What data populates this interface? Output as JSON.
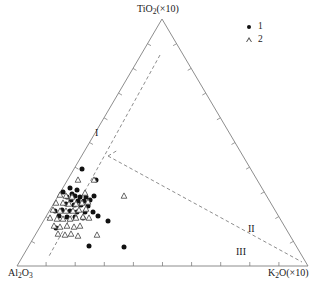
{
  "figure": {
    "type": "ternary-scatter",
    "width": 330,
    "height": 293,
    "background": "#ffffff",
    "line_color": "#808080",
    "marker_color_1": "#111111",
    "marker_color_2": "#555555"
  },
  "axes": {
    "top_label": "TiO₂(×10)",
    "top_label_parts": {
      "base": "TiO",
      "sub": "2",
      "suffix": "(×10)"
    },
    "left_label": "Al₂O₃",
    "left_label_parts": {
      "base": "Al",
      "sub": "2",
      "mid": "O",
      "sub2": "3"
    },
    "right_label": "K₂O(×10)",
    "right_label_parts": {
      "base": "K",
      "sub": "2",
      "suffix": "O(×10)"
    },
    "ticks_per_side": 10,
    "grid": false
  },
  "legend": {
    "position": "top-right",
    "items": [
      {
        "label": "1",
        "marker": "filled-circle",
        "icon": "circle-marker-icon"
      },
      {
        "label": "2",
        "marker": "open-triangle",
        "icon": "triangle-marker-icon"
      }
    ]
  },
  "regions": [
    {
      "id": "I",
      "label": "I",
      "x": 95,
      "y": 128
    },
    {
      "id": "II",
      "label": "II",
      "x": 248,
      "y": 224
    },
    {
      "id": "III",
      "label": "III",
      "x": 236,
      "y": 247
    }
  ],
  "chart_data": {
    "type": "scatter",
    "title": "",
    "xlabel": "",
    "ylabel": "",
    "projection": "ternary",
    "corners": {
      "top": {
        "component": "TiO2(×10)",
        "px": [
          162,
          19
        ]
      },
      "left": {
        "component": "Al2O3",
        "px": [
          17,
          266
        ]
      },
      "right": {
        "component": "K2O(×10)",
        "px": [
          308,
          266
        ]
      }
    },
    "axis_ranges": {
      "a": [
        0,
        100
      ],
      "b": [
        0,
        100
      ],
      "c": [
        0,
        100
      ]
    },
    "dividers": [
      {
        "name": "divider-I-II",
        "style": "dashed",
        "px": [
          [
            160,
            55
          ],
          [
            48,
            258
          ]
        ]
      },
      {
        "name": "divider-II-III",
        "style": "dashed",
        "px": [
          [
            108,
            156
          ],
          [
            302,
            262
          ]
        ]
      },
      {
        "name": "divider-junction",
        "style": "dashed",
        "px": [
          [
            108,
            156
          ],
          [
            118,
            150
          ]
        ]
      }
    ],
    "series": [
      {
        "name": "1",
        "marker": "filled-circle",
        "color": "#111111",
        "count": 34,
        "points_px": [
          [
            82,
            169
          ],
          [
            96,
            180
          ],
          [
            70,
            188
          ],
          [
            77,
            190
          ],
          [
            63,
            192
          ],
          [
            72,
            194
          ],
          [
            75,
            196
          ],
          [
            67,
            197
          ],
          [
            80,
            197
          ],
          [
            86,
            197
          ],
          [
            94,
            196
          ],
          [
            71,
            200
          ],
          [
            78,
            201
          ],
          [
            84,
            201
          ],
          [
            90,
            200
          ],
          [
            66,
            204
          ],
          [
            74,
            205
          ],
          [
            81,
            205
          ],
          [
            88,
            206
          ],
          [
            55,
            211
          ],
          [
            62,
            210
          ],
          [
            70,
            211
          ],
          [
            77,
            212
          ],
          [
            85,
            212
          ],
          [
            93,
            212
          ],
          [
            59,
            216
          ],
          [
            67,
            217
          ],
          [
            75,
            217
          ],
          [
            83,
            218
          ],
          [
            98,
            216
          ],
          [
            108,
            221
          ],
          [
            56,
            228
          ],
          [
            89,
            246
          ],
          [
            124,
            247
          ]
        ]
      },
      {
        "name": "2",
        "marker": "open-triangle",
        "color": "#555555",
        "count": 36,
        "points_px": [
          [
            78,
            180
          ],
          [
            94,
            180
          ],
          [
            60,
            195
          ],
          [
            66,
            196
          ],
          [
            72,
            197
          ],
          [
            85,
            193
          ],
          [
            56,
            203
          ],
          [
            63,
            203
          ],
          [
            69,
            204
          ],
          [
            76,
            204
          ],
          [
            82,
            203
          ],
          [
            88,
            202
          ],
          [
            53,
            210
          ],
          [
            60,
            211
          ],
          [
            66,
            211
          ],
          [
            73,
            211
          ],
          [
            79,
            210
          ],
          [
            86,
            209
          ],
          [
            50,
            218
          ],
          [
            57,
            219
          ],
          [
            63,
            219
          ],
          [
            70,
            219
          ],
          [
            76,
            218
          ],
          [
            83,
            217
          ],
          [
            54,
            226
          ],
          [
            60,
            227
          ],
          [
            67,
            226
          ],
          [
            74,
            227
          ],
          [
            80,
            226
          ],
          [
            58,
            234
          ],
          [
            65,
            235
          ],
          [
            71,
            234
          ],
          [
            78,
            236
          ],
          [
            97,
            235
          ],
          [
            124,
            196
          ],
          [
            89,
            218
          ]
        ]
      }
    ]
  }
}
